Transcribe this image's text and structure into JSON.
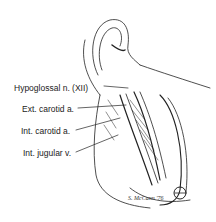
{
  "figure": {
    "labels": [
      {
        "text": "Hypoglossal n. (XII)",
        "x": 14,
        "y": 83
      },
      {
        "text": "Ext. carotid a.",
        "x": 22,
        "y": 106
      },
      {
        "text": "Int. carotid a.",
        "x": 21,
        "y": 127
      },
      {
        "text": "Int. jugular v.",
        "x": 23,
        "y": 150
      }
    ],
    "signature": "S. McCann '76"
  },
  "colors": {
    "ink": "#222222",
    "background": "#ffffff"
  }
}
